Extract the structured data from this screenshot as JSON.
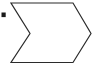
{
  "canvas": {
    "width": 98,
    "height": 68,
    "background_color": "#ffffff"
  },
  "diagram": {
    "stroke_color": "#2b2b2b",
    "stroke_width": 1.2,
    "fill_color": "none",
    "shapes": [
      {
        "name": "bullet-marker",
        "type": "rect",
        "fill_color": "#1a1a1a",
        "x": 1.5,
        "y": 12.5,
        "width": 4.2,
        "height": 4.6
      },
      {
        "name": "chevron-arrow",
        "type": "polygon",
        "points": "11,3 73,3 91,33.5 73,62.5 11,62.5 30,33.5",
        "vertices": [
          {
            "label": "top-left",
            "x": 11,
            "y": 3
          },
          {
            "label": "top-right",
            "x": 73,
            "y": 3
          },
          {
            "label": "right-tip",
            "x": 91,
            "y": 33.5
          },
          {
            "label": "bottom-right",
            "x": 73,
            "y": 62.5
          },
          {
            "label": "bottom-left",
            "x": 11,
            "y": 62.5
          },
          {
            "label": "notch-point",
            "x": 30,
            "y": 33.5
          }
        ]
      }
    ]
  }
}
